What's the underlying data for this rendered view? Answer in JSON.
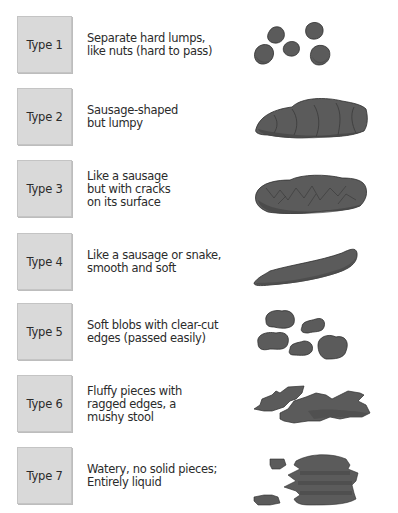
{
  "chart": {
    "title_visible": false,
    "fill_color": "#5b5b5b",
    "shade_color": "#4a4a4a",
    "outline_color": "#2e2e2e",
    "box_color": "#d9d9d9",
    "types": [
      {
        "label": "Type 1",
        "description": "Separate hard lumps,\nlike nuts (hard to pass)",
        "illustration": "separate-hard-lumps-icon"
      },
      {
        "label": "Type 2",
        "description": "Sausage-shaped\nbut lumpy",
        "illustration": "lumpy-sausage-icon"
      },
      {
        "label": "Type 3",
        "description": "Like a sausage\nbut with cracks\non its surface",
        "illustration": "cracked-sausage-icon"
      },
      {
        "label": "Type 4",
        "description": "Like a sausage or snake,\nsmooth and soft",
        "illustration": "smooth-snake-icon"
      },
      {
        "label": "Type 5",
        "description": "Soft blobs with clear-cut\nedges (passed easily)",
        "illustration": "soft-blobs-icon"
      },
      {
        "label": "Type 6",
        "description": "Fluffy pieces with\nragged edges, a\nmushy stool",
        "illustration": "fluffy-pieces-icon"
      },
      {
        "label": "Type 7",
        "description": "Watery, no solid pieces;\nEntirely liquid",
        "illustration": "watery-liquid-icon"
      }
    ]
  }
}
